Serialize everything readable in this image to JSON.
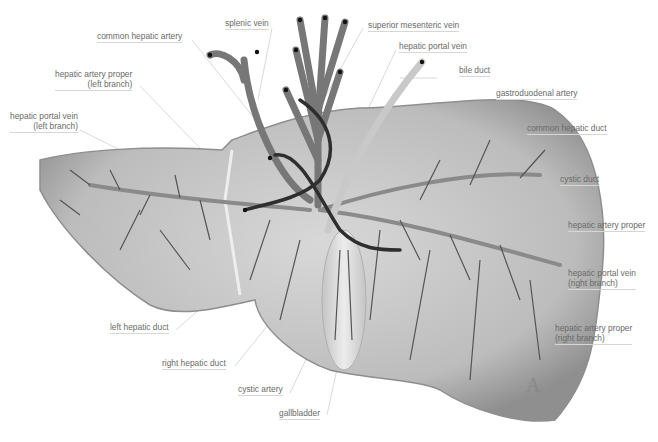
{
  "figure": {
    "panel_letter": "A",
    "colors": {
      "liver_fill": "#bdbdbd",
      "liver_edge": "#8e8e8e",
      "portal_vein": "#7a7a7a",
      "artery": "#3a3a3a",
      "duct": "#d3d3d3",
      "label_text": "#6a6a6a",
      "leader_line": "#cfcfcf"
    },
    "labels": [
      {
        "id": "common-hepatic-artery",
        "lines": [
          "common hepatic artery"
        ]
      },
      {
        "id": "splenic-vein",
        "lines": [
          "splenic vein"
        ]
      },
      {
        "id": "superior-mesenteric-vein",
        "lines": [
          "superior mesenteric vein"
        ]
      },
      {
        "id": "hepatic-portal-vein",
        "lines": [
          "hepatic portal vein"
        ]
      },
      {
        "id": "bile-duct",
        "lines": [
          "bile duct"
        ]
      },
      {
        "id": "hepatic-artery-proper-left",
        "lines": [
          "hepatic artery proper",
          "(left branch)"
        ]
      },
      {
        "id": "gastroduodenal-artery",
        "lines": [
          "gastroduodenal artery"
        ]
      },
      {
        "id": "hepatic-portal-vein-left",
        "lines": [
          "hepatic portal vein",
          "(left branch)"
        ]
      },
      {
        "id": "common-hepatic-duct",
        "lines": [
          "common hepatic duct"
        ]
      },
      {
        "id": "cystic-duct",
        "lines": [
          "cystic duct"
        ]
      },
      {
        "id": "hepatic-artery-proper",
        "lines": [
          "hepatic artery proper"
        ]
      },
      {
        "id": "hepatic-portal-vein-right",
        "lines": [
          "hepatic portal vein",
          "(right branch)"
        ]
      },
      {
        "id": "left-hepatic-duct",
        "lines": [
          "left hepatic duct"
        ]
      },
      {
        "id": "hepatic-artery-proper-right",
        "lines": [
          "hepatic artery proper",
          "(right branch)"
        ]
      },
      {
        "id": "right-hepatic-duct",
        "lines": [
          "right hepatic duct"
        ]
      },
      {
        "id": "cystic-artery",
        "lines": [
          "cystic artery"
        ]
      },
      {
        "id": "gallbladder",
        "lines": [
          "gallbladder"
        ]
      }
    ]
  }
}
